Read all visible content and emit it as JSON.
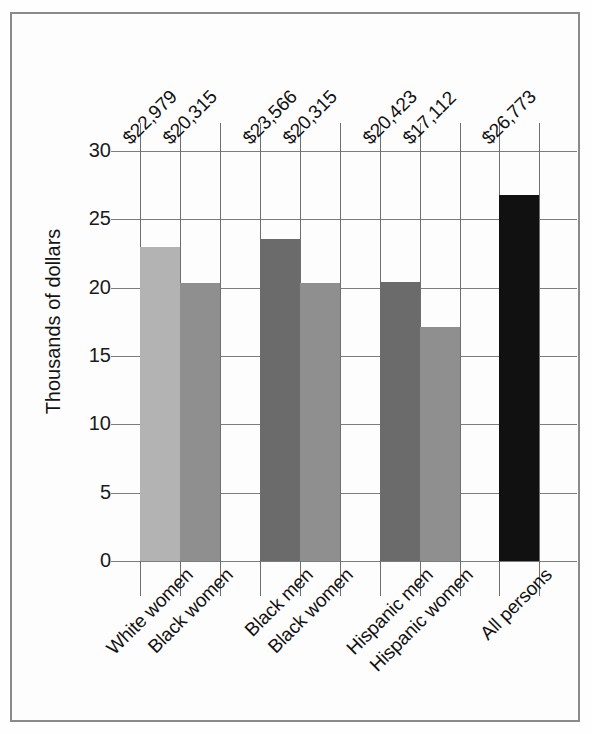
{
  "chart_data": {
    "type": "bar",
    "title": "",
    "subtitle": "",
    "xlabel": "",
    "ylabel": "Thousands of dollars",
    "categories": [
      "White women",
      "Black women",
      "Black men",
      "Black women",
      "Hispanic men",
      "Hispanic women",
      "All persons"
    ],
    "values": [
      22.979,
      20.315,
      23.566,
      20.315,
      20.423,
      17.112,
      26.773
    ],
    "value_labels": [
      "$22,979",
      "$20,315",
      "$23,566",
      "$20,315",
      "$20,423",
      "$17,112",
      "$26,773"
    ],
    "bar_colors": [
      "#b3b3b3",
      "#8f8f8f",
      "#6b6b6b",
      "#8f8f8f",
      "#6b6b6b",
      "#8f8f8f",
      "#111111"
    ],
    "ylim": [
      0,
      30
    ],
    "yticks": [
      0,
      5,
      10,
      15,
      20,
      25,
      30
    ],
    "ytick_labels": [
      "0",
      "5",
      "10",
      "15",
      "20",
      "25",
      "30"
    ],
    "grid": true,
    "grid_axis": "both",
    "legend": false,
    "legend_position": "none",
    "groups": [
      {
        "label_indices": [
          0,
          1
        ]
      },
      {
        "label_indices": [
          2,
          3
        ]
      },
      {
        "label_indices": [
          4,
          5
        ]
      },
      {
        "label_indices": [
          6
        ]
      }
    ]
  },
  "figure": {
    "frame_color": "#8a8a8a",
    "background": "#fdfdfd",
    "gridline_color": "#7d7d7d",
    "text_color": "#111111"
  }
}
